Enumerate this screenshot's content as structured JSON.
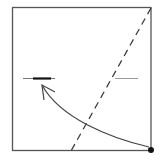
{
  "diagram": {
    "type": "origami-fold-step",
    "square": {
      "x": 12,
      "y": 7,
      "size": 139,
      "stroke": "#555555"
    },
    "fold_line": {
      "style": "valley-dashed",
      "x1": 151,
      "y1": 7,
      "x2": 71,
      "y2": 151,
      "color": "#333333"
    },
    "left_mark": {
      "x1": 23,
      "x2": 55,
      "y": 78,
      "bold_x1": 33,
      "bold_x2": 51,
      "color": "#666666",
      "bold_color": "#111111"
    },
    "right_mark": {
      "x1": 115,
      "x2": 138,
      "y": 78,
      "color": "#999999"
    },
    "arrow": {
      "from": [
        151,
        148
      ],
      "to": [
        42,
        85
      ],
      "color": "#444444"
    },
    "corner_dot": {
      "cx": 151,
      "cy": 150,
      "r": 3,
      "color": "#111111"
    }
  }
}
